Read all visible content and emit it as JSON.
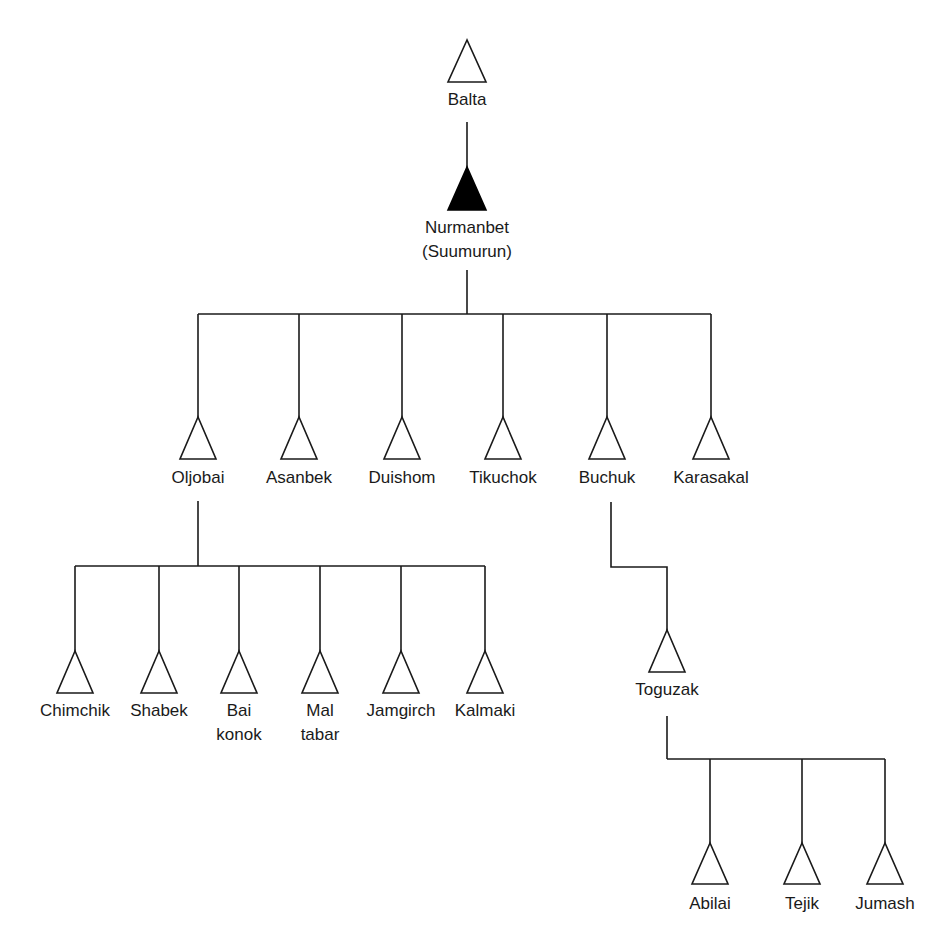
{
  "diagram": {
    "type": "kinship-genealogy",
    "root": {
      "name": "Balta",
      "children": [
        {
          "name": "Nurmanbet",
          "alias": "(Suumurun)",
          "ego": true,
          "children": [
            {
              "name": "Oljobai",
              "children": [
                {
                  "name": "Chimchik"
                },
                {
                  "name": "Shabek"
                },
                {
                  "name": "Bai konok"
                },
                {
                  "name": "Mal tabar"
                },
                {
                  "name": "Jamgirch"
                },
                {
                  "name": "Kalmaki"
                }
              ]
            },
            {
              "name": "Asanbek"
            },
            {
              "name": "Duishom"
            },
            {
              "name": "Tikuchok"
            },
            {
              "name": "Buchuk",
              "children": [
                {
                  "name": "Toguzak",
                  "children": [
                    {
                      "name": "Abilai"
                    },
                    {
                      "name": "Tejik"
                    },
                    {
                      "name": "Jumash"
                    }
                  ]
                }
              ]
            },
            {
              "name": "Karasakal"
            }
          ]
        }
      ]
    }
  },
  "labels": {
    "balta": "Balta",
    "nurmanbet": "Nurmanbet\n(Suumurun)",
    "oljobai": "Oljobai",
    "asanbek": "Asanbek",
    "duishom": "Duishom",
    "tikuchok": "Tikuchok",
    "buchuk": "Buchuk",
    "karasakal": "Karasakal",
    "chimchik": "Chimchik",
    "shabek": "Shabek",
    "bai_konok": "Bai\nkonok",
    "mal_tabar": "Mal\ntabar",
    "jamgirch": "Jamgirch",
    "kalmaki": "Kalmaki",
    "toguzak": "Toguzak",
    "abilai": "Abilai",
    "tejik": "Tejik",
    "jumash": "Jumash"
  },
  "legend": {
    "open_triangle": "male",
    "filled_triangle": "ego (male)"
  },
  "colors": {
    "line": "#1a1a1a",
    "background": "#ffffff",
    "ego_fill": "#000000"
  }
}
